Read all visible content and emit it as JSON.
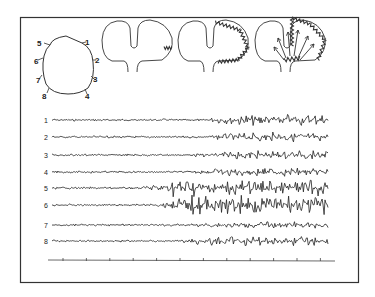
{
  "figure": {
    "frame_color": "#333333",
    "trace_color": "#222222",
    "electrode_labels": [
      "1",
      "2",
      "3",
      "4",
      "5",
      "6",
      "7",
      "8"
    ],
    "panels": [
      {
        "id": "montage",
        "label": "head-electrode-montage"
      },
      {
        "id": "stage1",
        "label": "focal-discharge"
      },
      {
        "id": "stage2",
        "label": "cortical-spread"
      },
      {
        "id": "stage3",
        "label": "generalized-spread"
      }
    ],
    "channels": [
      {
        "label": "1",
        "y": 120,
        "onset": 0.55,
        "amp": 6
      },
      {
        "label": "2",
        "y": 137,
        "onset": 0.55,
        "amp": 5
      },
      {
        "label": "3",
        "y": 155,
        "onset": 0.5,
        "amp": 4.5
      },
      {
        "label": "4",
        "y": 172,
        "onset": 0.5,
        "amp": 4.5
      },
      {
        "label": "5",
        "y": 188,
        "onset": 0.3,
        "amp": 9
      },
      {
        "label": "6",
        "y": 205,
        "onset": 0.38,
        "amp": 11
      },
      {
        "label": "7",
        "y": 225,
        "onset": 0.5,
        "amp": 3.5
      },
      {
        "label": "8",
        "y": 241,
        "onset": 0.45,
        "amp": 5
      }
    ],
    "time_axis_ticks": 12
  }
}
